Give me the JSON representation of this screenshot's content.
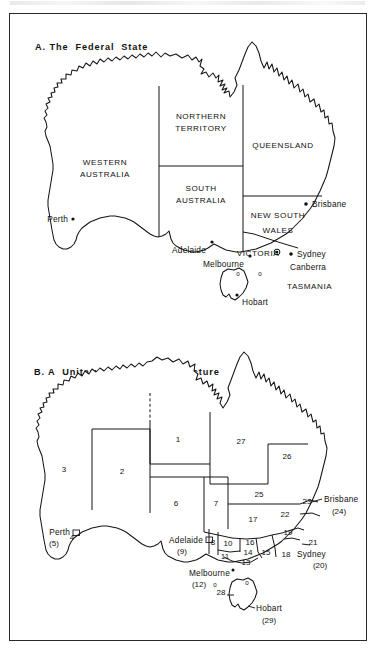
{
  "figure": {
    "panel_a": {
      "title": "A. The  Federal  State",
      "state_labels": [
        {
          "name": "WESTERN AUSTRALIA",
          "lines": [
            "WESTERN",
            "AUSTRALIA"
          ]
        },
        {
          "name": "NORTHERN TERRITORY",
          "lines": [
            "NORTHERN",
            "TERRITORY"
          ]
        },
        {
          "name": "QUEENSLAND",
          "lines": [
            "QUEENSLAND"
          ]
        },
        {
          "name": "SOUTH AUSTRALIA",
          "lines": [
            "SOUTH",
            "AUSTRALIA"
          ]
        },
        {
          "name": "NEW SOUTH WALES",
          "lines": [
            "NEW  SOUTH",
            "WALES"
          ]
        },
        {
          "name": "VICTORIA",
          "lines": [
            "VICTORIA"
          ]
        },
        {
          "name": "TASMANIA",
          "lines": [
            "TASMANIA"
          ]
        }
      ],
      "cities": [
        {
          "name": "Perth"
        },
        {
          "name": "Adelaide"
        },
        {
          "name": "Brisbane"
        },
        {
          "name": "Sydney"
        },
        {
          "name": "Canberra"
        },
        {
          "name": "Melbourne"
        },
        {
          "name": "Hobart"
        }
      ]
    },
    "panel_b": {
      "title_line1": "B. A  Unitary - Provincial  Structure",
      "title_line2": "Labor  Party  Scheme",
      "title_line3": "of  1920",
      "region_numbers": [
        "1",
        "2",
        "3",
        "4",
        "6",
        "7",
        "8",
        "10",
        "11",
        "13",
        "14",
        "15",
        "16",
        "17",
        "18",
        "19",
        "21",
        "22",
        "23",
        "25",
        "26",
        "27",
        "28"
      ],
      "cities": [
        {
          "name": "Perth",
          "number": "(5)"
        },
        {
          "name": "Adelaide",
          "number": "(9)"
        },
        {
          "name": "Melbourne",
          "number": "(12)"
        },
        {
          "name": "Brisbane",
          "number": "(24)"
        },
        {
          "name": "Sydney",
          "number": "(20)"
        },
        {
          "name": "Hobart",
          "number": "(29)"
        }
      ]
    }
  },
  "colors": {
    "ink": "#151515",
    "paper": "#ffffff",
    "frame": "#2a2a2a"
  }
}
